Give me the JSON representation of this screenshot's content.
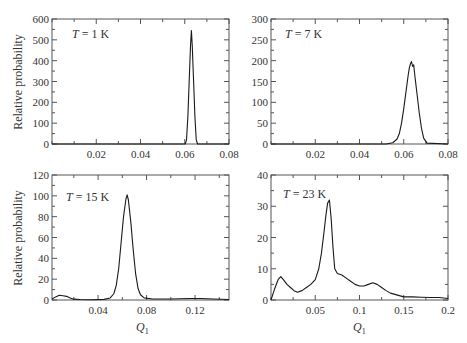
{
  "chart_data": [
    {
      "type": "line",
      "panel": "top-left",
      "annotation": {
        "italic": "T",
        "rest": " = 1 K"
      },
      "xlabel": "",
      "ylabel": "Relative probability",
      "xlim": [
        0.0,
        0.08
      ],
      "ylim": [
        0,
        600
      ],
      "xticks": [
        0.02,
        0.04,
        0.06,
        0.08
      ],
      "xtick_labels": [
        "0.02",
        "0.04",
        "0.06",
        "0.08"
      ],
      "yticks": [
        0,
        100,
        200,
        300,
        400,
        500,
        600
      ],
      "ytick_labels": [
        "0",
        "100",
        "200",
        "300",
        "400",
        "500",
        "600"
      ],
      "grid": false,
      "x": [
        0.0,
        0.058,
        0.0602,
        0.0608,
        0.0614,
        0.062,
        0.0626,
        0.063,
        0.0634,
        0.064,
        0.0646,
        0.0652,
        0.0658,
        0.08
      ],
      "y": [
        0,
        0,
        0,
        20,
        130,
        300,
        470,
        545,
        470,
        300,
        130,
        20,
        0,
        0
      ]
    },
    {
      "type": "line",
      "panel": "top-right",
      "annotation": {
        "italic": "T",
        "rest": " = 7 K"
      },
      "xlabel": "",
      "ylabel": "",
      "xlim": [
        0.0,
        0.08
      ],
      "ylim": [
        0,
        300
      ],
      "xticks": [
        0.02,
        0.04,
        0.06,
        0.08
      ],
      "xtick_labels": [
        "0.02",
        "0.04",
        "0.06",
        "0.08"
      ],
      "yticks": [
        0,
        50,
        100,
        150,
        200,
        250,
        300
      ],
      "ytick_labels": [
        "0",
        "50",
        "100",
        "150",
        "200",
        "250",
        "300"
      ],
      "grid": false,
      "x": [
        0.0,
        0.052,
        0.055,
        0.057,
        0.058,
        0.059,
        0.06,
        0.061,
        0.062,
        0.0625,
        0.063,
        0.0635,
        0.064,
        0.0645,
        0.065,
        0.066,
        0.067,
        0.068,
        0.069,
        0.0705,
        0.08
      ],
      "y": [
        0,
        0,
        3,
        12,
        25,
        50,
        85,
        125,
        165,
        182,
        192,
        198,
        186,
        190,
        165,
        120,
        75,
        38,
        14,
        2,
        0
      ]
    },
    {
      "type": "line",
      "panel": "bottom-left",
      "annotation": {
        "italic": "T",
        "rest": " = 15 K"
      },
      "xlabel": "Q1",
      "ylabel": "Relative probability",
      "xlim": [
        0.002,
        0.148
      ],
      "ylim": [
        0,
        120
      ],
      "xticks": [
        0.04,
        0.08,
        0.12
      ],
      "xtick_labels": [
        "0.04",
        "0.08",
        "0.12"
      ],
      "yticks": [
        0,
        20,
        40,
        60,
        80,
        100,
        120
      ],
      "ytick_labels": [
        "0",
        "20",
        "40",
        "60",
        "80",
        "100",
        "120"
      ],
      "grid": false,
      "x": [
        0.002,
        0.005,
        0.008,
        0.011,
        0.014,
        0.017,
        0.02,
        0.025,
        0.035,
        0.045,
        0.05,
        0.053,
        0.055,
        0.057,
        0.059,
        0.061,
        0.063,
        0.064,
        0.065,
        0.067,
        0.069,
        0.071,
        0.073,
        0.075,
        0.078,
        0.085,
        0.1,
        0.115,
        0.125,
        0.135,
        0.148
      ],
      "y": [
        1,
        3,
        4.5,
        4,
        3.5,
        2,
        0.8,
        0.5,
        0.3,
        0.6,
        2,
        6,
        14,
        30,
        55,
        80,
        97,
        101,
        96,
        75,
        48,
        25,
        11,
        5,
        2,
        1,
        1,
        1.5,
        1.5,
        1,
        0.5
      ]
    },
    {
      "type": "line",
      "panel": "bottom-right",
      "annotation": {
        "italic": "T",
        "rest": " = 23 K"
      },
      "xlabel": "Q1",
      "ylabel": "",
      "xlim": [
        0.0,
        0.2
      ],
      "ylim": [
        0,
        40
      ],
      "xticks": [
        0.05,
        0.1,
        0.15,
        0.2
      ],
      "xtick_labels": [
        "0.05",
        "0.1",
        "0.15",
        "0.2"
      ],
      "yticks": [
        0,
        10,
        20,
        30,
        40
      ],
      "ytick_labels": [
        "0",
        "10",
        "20",
        "30",
        "40"
      ],
      "grid": false,
      "x": [
        0.0,
        0.004,
        0.008,
        0.011,
        0.014,
        0.018,
        0.022,
        0.026,
        0.03,
        0.035,
        0.04,
        0.045,
        0.05,
        0.054,
        0.057,
        0.06,
        0.062,
        0.064,
        0.066,
        0.068,
        0.07,
        0.072,
        0.075,
        0.08,
        0.085,
        0.09,
        0.095,
        0.1,
        0.105,
        0.11,
        0.115,
        0.12,
        0.125,
        0.13,
        0.135,
        0.14,
        0.145,
        0.15,
        0.16,
        0.17,
        0.18,
        0.19,
        0.2
      ],
      "y": [
        0,
        3.5,
        6.5,
        7.5,
        6.5,
        5,
        4,
        3,
        2.5,
        3,
        4,
        5,
        6.5,
        10,
        15,
        22,
        27,
        31,
        32,
        26,
        17,
        10,
        8.5,
        8,
        7,
        6,
        5,
        4.5,
        4.5,
        5,
        5.5,
        5,
        4,
        3,
        2.2,
        1.8,
        1.4,
        1,
        1,
        0.9,
        0.8,
        0.8,
        0.5
      ]
    }
  ],
  "panels": [
    {
      "annotation_italic": "T",
      "annotation_rest": " = 1 K",
      "ylabel": "Relative probability",
      "xlabel": ""
    },
    {
      "annotation_italic": "T",
      "annotation_rest": " = 7 K",
      "ylabel": "",
      "xlabel": ""
    },
    {
      "annotation_italic": "T",
      "annotation_rest": " = 15 K",
      "ylabel": "Relative probability",
      "xlabel_main": "Q",
      "xlabel_sub": "1"
    },
    {
      "annotation_italic": "T",
      "annotation_rest": " = 23 K",
      "ylabel": "",
      "xlabel_main": "Q",
      "xlabel_sub": "1"
    }
  ]
}
